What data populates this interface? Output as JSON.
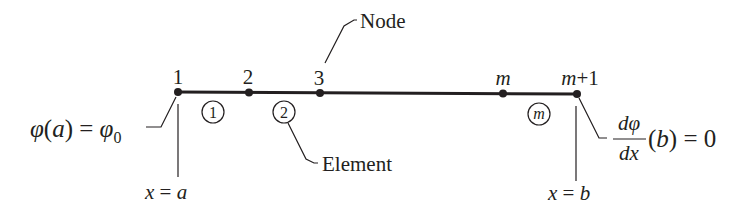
{
  "diagram": {
    "colors": {
      "ink": "#231f20",
      "background": "#ffffff"
    },
    "nodes": [
      {
        "label": "1",
        "x": 178
      },
      {
        "label": "2",
        "x": 249
      },
      {
        "label": "3",
        "x": 320
      },
      {
        "label": "m",
        "x": 503
      },
      {
        "label": "m+1",
        "x": 577
      }
    ],
    "elements": [
      {
        "label": "1",
        "x": 213
      },
      {
        "label": "2",
        "x": 284
      },
      {
        "label": "m",
        "x": 539
      }
    ],
    "callouts": {
      "node": "Node",
      "element": "Element"
    },
    "left_boundary": {
      "condition_lhs": "φ(a) = φ",
      "condition_sub": "0",
      "position_x": "x",
      "position_eq": " = ",
      "position_val": "a"
    },
    "right_boundary": {
      "numerator": "dφ",
      "denominator": "dx",
      "rest": "(b) = 0",
      "position_x": "x",
      "position_eq": " = ",
      "position_val": "b"
    }
  }
}
